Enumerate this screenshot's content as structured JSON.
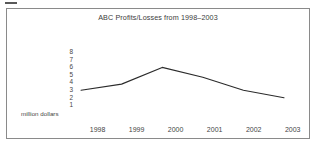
{
  "figure": {
    "artifact_mark": "",
    "frame_border_color": "#8a8a8a",
    "background_color": "#ffffff"
  },
  "chart_data": {
    "type": "line",
    "title": "ABC Profits/Losses from 1998–2003",
    "xlabel": "",
    "ylabel": "million dollars",
    "categories": [
      "1998",
      "1999",
      "2000",
      "2001",
      "2002",
      "2003"
    ],
    "values": [
      4.0,
      4.8,
      7.0,
      5.7,
      4.0,
      3.0
    ],
    "series": [
      {
        "name": "ABC Profits/Losses",
        "values": [
          4.0,
          4.8,
          7.0,
          5.7,
          4.0,
          3.0
        ],
        "color": "#2b2b2b"
      }
    ],
    "ytick_labels": [
      "8",
      "7",
      "6",
      "5",
      "4",
      "3",
      "2",
      "1"
    ],
    "ylim": [
      0,
      8
    ],
    "xlim_categories": 6,
    "grid": false,
    "legend": false,
    "markers": false,
    "line_color": "#2b2b2b",
    "axis_unit_caption": "million dollars"
  }
}
